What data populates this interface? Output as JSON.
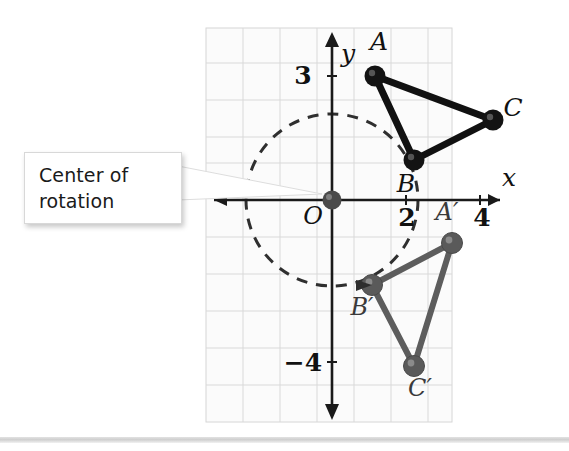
{
  "figure": {
    "type": "coordinate-plane-rotation-diagram",
    "callout": {
      "line1": "Center of",
      "line2": "rotation"
    },
    "axes": {
      "x_label": "x",
      "y_label": "y",
      "origin_label": "O",
      "x_ticks": [
        {
          "label": "2",
          "value": 2
        },
        {
          "label": "4",
          "value": 4
        }
      ],
      "y_ticks": [
        {
          "label": "3",
          "value": 3
        },
        {
          "label": "−4",
          "value": -4
        }
      ]
    },
    "preimage": {
      "name": "triangle-ABC",
      "color": "#111111",
      "vertices": [
        {
          "label": "A",
          "x": 1.15,
          "y": 3.35
        },
        {
          "label": "B",
          "x": 2.2,
          "y": 1.08
        },
        {
          "label": "C",
          "x": 4.35,
          "y": 2.15
        }
      ]
    },
    "image": {
      "name": "triangle-A-prime-B-prime-C-prime",
      "color": "#5d5d5d",
      "vertices": [
        {
          "label": "A′",
          "x": 3.25,
          "y": -1.15
        },
        {
          "label": "B′",
          "x": 1.08,
          "y": -2.28
        },
        {
          "label": "C′",
          "x": 2.22,
          "y": -4.45
        }
      ]
    },
    "rotation_arc": {
      "style": "dashed",
      "color": "#2c2c2c",
      "center": {
        "x": 0,
        "y": 0
      },
      "radius_units": 2.3
    },
    "center_point": {
      "label": "O",
      "x": 0,
      "y": 0,
      "color": "#4a4a4a"
    }
  },
  "colors": {
    "grid": "#d6d6d6",
    "plot_background": "#fbfbfb",
    "axis": "#1a1a1a",
    "preimage": "#111111",
    "image": "#5d5d5d"
  }
}
